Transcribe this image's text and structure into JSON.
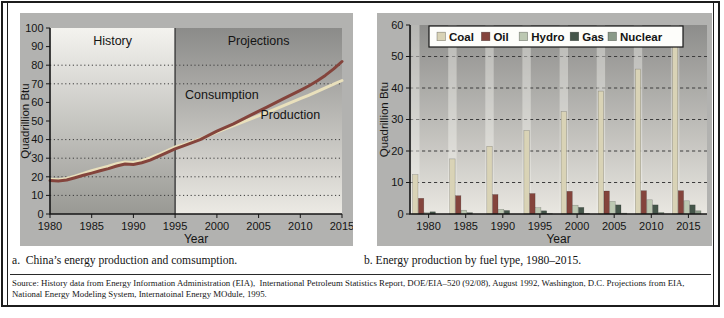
{
  "figure": {
    "caption_a": "a.  China’s energy production and comsumption.",
    "caption_b": "b. Energy production by fuel type, 1980–2015.",
    "source": "Source: History data from Energy Information Administration (EIA),  International Petroleum Statistics Report, DOE/EIA–520 (92/08), August 1992, Washington, D.C. Projections from EIA, National Energy Modeling System, Internatoinal Energy MOdule, 1995."
  },
  "chart_data": [
    {
      "id": "china-energy-line",
      "type": "line",
      "title": "",
      "xlabel": "Year",
      "ylabel": "Quadrillion Btu",
      "xlim": [
        1980,
        2015
      ],
      "ylim": [
        0,
        100
      ],
      "xticks": [
        1980,
        1985,
        1990,
        1995,
        2000,
        2005,
        2010,
        2015
      ],
      "yticks": [
        0,
        10,
        20,
        30,
        40,
        50,
        60,
        70,
        80,
        90,
        100
      ],
      "gridlines_y": [
        10,
        20,
        30,
        40,
        70,
        80
      ],
      "grid_style": "dotted",
      "legend_position": "none",
      "divider_x": 1995,
      "regions": [
        {
          "label": "History",
          "from": 1980,
          "to": 1995
        },
        {
          "label": "Projections",
          "from": 1995,
          "to": 2015
        }
      ],
      "series": [
        {
          "name": "Production",
          "color": "#e9e0bc",
          "x": [
            1980,
            1981,
            1982,
            1983,
            1984,
            1985,
            1986,
            1987,
            1988,
            1989,
            1990,
            1991,
            1992,
            1993,
            1994,
            1995,
            1996,
            1998,
            2000,
            2002,
            2004,
            2006,
            2008,
            2010,
            2011,
            2012,
            2013,
            2014,
            2015
          ],
          "values": [
            18.7,
            18.4,
            19.1,
            20.4,
            21.8,
            23.3,
            24.5,
            25.7,
            27,
            28,
            27.7,
            28.7,
            30.1,
            32,
            34,
            36,
            37.3,
            40.3,
            44,
            47.5,
            51,
            54.5,
            58.3,
            62,
            63.8,
            65.8,
            67.8,
            69.8,
            71.8
          ],
          "label": {
            "text": "Production",
            "x": 2008.8,
            "y": 51
          }
        },
        {
          "name": "Consumption",
          "color": "#84443c",
          "x": [
            1980,
            1981,
            1982,
            1983,
            1984,
            1985,
            1986,
            1987,
            1988,
            1989,
            1990,
            1991,
            1992,
            1993,
            1994,
            1995,
            1996,
            1998,
            2000,
            2002,
            2004,
            2006,
            2008,
            2010,
            2011,
            2012,
            2013,
            2014,
            2015
          ],
          "values": [
            18,
            17.7,
            18.3,
            19.5,
            20.8,
            22,
            23.2,
            24.4,
            25.8,
            26.9,
            26.6,
            27.6,
            29,
            31,
            33,
            35,
            36.6,
            40,
            44.5,
            48.5,
            53,
            57.5,
            62,
            66.5,
            68.8,
            71.5,
            74.5,
            78,
            82
          ],
          "label": {
            "text": "Consumption",
            "x": 2000.6,
            "y": 62
          }
        }
      ]
    },
    {
      "id": "fuel-type-bars",
      "type": "bar",
      "title": "",
      "xlabel": "Year",
      "ylabel": "Quadrillion Btu",
      "ylim": [
        0,
        60
      ],
      "yticks": [
        0,
        10,
        20,
        30,
        40,
        50,
        60
      ],
      "gridlines_y": [
        10,
        20,
        30,
        40,
        50
      ],
      "grid_style": "dashed",
      "legend_position": "top",
      "categories": [
        1980,
        1985,
        1990,
        1995,
        2000,
        2005,
        2010,
        2015
      ],
      "series": [
        {
          "name": "Coal",
          "color": "#d9d3b6",
          "values": [
            12.5,
            17.5,
            21.5,
            26.5,
            32.5,
            39,
            46,
            55.5
          ]
        },
        {
          "name": "Oil",
          "color": "#84443c",
          "values": [
            5,
            5.8,
            6.2,
            6.5,
            7.2,
            7.3,
            7.4,
            7.4
          ]
        },
        {
          "name": "Hydro",
          "color": "#bcc8b2",
          "values": [
            0.4,
            1.2,
            1.5,
            2,
            2.8,
            4,
            4.5,
            4.2
          ]
        },
        {
          "name": "Gas",
          "color": "#45564a",
          "values": [
            0.7,
            0.4,
            1.1,
            1,
            2.1,
            2.9,
            2.9,
            2.9
          ]
        },
        {
          "name": "Nuclear",
          "color": "#8a9a88",
          "values": [
            0,
            0,
            0,
            0.1,
            0.2,
            0.3,
            0.5,
            1
          ]
        }
      ]
    }
  ],
  "colors": {
    "panel_bg": "#b2b2b0",
    "frame": "#1c1c1c",
    "history_grad_top": "#f4f3ef",
    "history_grad_bottom": "#999994",
    "projections_grad_top": "#8b8b89",
    "projections_grad_bottom": "#eceae4",
    "bar_plot_grad_top": "#8d8d8b",
    "bar_plot_grad_bottom": "#e9e7e1",
    "legend_bg": "#fdfdfa"
  }
}
